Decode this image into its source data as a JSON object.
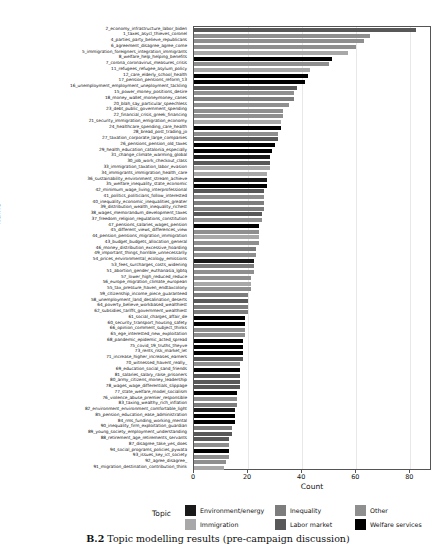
{
  "chart_data": {
    "type": "bar",
    "orientation": "horizontal",
    "title": "",
    "xlabel": "Count",
    "ylabel": "Name",
    "xlim": [
      0,
      88
    ],
    "xticks": [
      0,
      20,
      40,
      60,
      80
    ],
    "grid": true,
    "legend_title": "Topic",
    "legend_position": "bottom",
    "legend": [
      {
        "label": "Environment/energy",
        "color": "#1a1a1a"
      },
      {
        "label": "Inequality",
        "color": "#7d7d7d"
      },
      {
        "label": "Other",
        "color": "#8f8f8f"
      },
      {
        "label": "Immigration",
        "color": "#a8a8a8"
      },
      {
        "label": "Labor market",
        "color": "#585858"
      },
      {
        "label": "Welfare services",
        "color": "#000000"
      }
    ],
    "categories": [
      "2_economy_infrastructure_labor_biden",
      "1_taxes_asycl_thieves_coronel",
      "4_parties_party_believe_republicans",
      "6_agreement_disagree_agree_come",
      "5_immigration_foreigners_integration_immigrants",
      "8_welfare_help_helping_benefits",
      "7_corona_coronavirus_measures_crisis",
      "11_refugees_refugee_asylum_policy",
      "12_care_elderly_school_health",
      "17_pension_pensions_reform_13",
      "16_unemployment_employment_uneployment_tackling",
      "15_power_money_positions_desire",
      "18_money_wallet_moneymoney_canes",
      "20_blah_say_particular_speechless",
      "23_debt_public_government_spending",
      "22_financial_crisis_greek_financing",
      "21_security_immigration_emigration_economy",
      "24_healthcare_spending_care_health",
      "28_bread_post_trading_jo",
      "27_taxation_corporate_large_companies",
      "26_pensions_pension_old_taxes",
      "29_health_education_catalonia_especially",
      "31_change_climate_warming_global",
      "30_job_work_checkout_class",
      "33_immigration_taxation_labor_evasion",
      "34_immigrants_immigration_health_care",
      "36_sustainability_environment_stream_achieve",
      "35_welfare_inequality_state_economic",
      "42_minimum_wage_living_interprofessional",
      "41_politics_politicians_follow_interested",
      "40_inequality_economic_inequalities_greater",
      "39_distribution_wealth_inequality_richest",
      "38_wages_memorandum_development_taxes",
      "37_freedom_religion_regulations_constitution",
      "47_pensions_salaries_wages_pension",
      "45_different_views_differences_view",
      "44_pension_pensions_migration_immigration",
      "43_budget_budgets_allocation_general",
      "46_money_distribution_excessive_hoarding",
      "49_important_things_horrible_unnecessarily",
      "54_prices_environmental_ecology_emissions",
      "53_fees_surcharges_costs_widening",
      "51_abortion_gender_euthanasia_lgbtq",
      "57_lower_high_reduced_reduce",
      "56_europe_migration_climate_european",
      "55_tax_pressure_haven_endtaxcolony",
      "59_citizenship_income_piece_guaranteed",
      "58_unemployment_land_desalination_deserts",
      "64_poverty_believe_workbased_wealthiest",
      "62_subsidies_tariffs_government_wealthiest",
      "61_social_charges_affair_de",
      "60_security_transport_housing_safety",
      "66_opinion_comment_subject_thinks",
      "65_ege_interested_new_exploitation",
      "68_pandemic_epidemic_acted_spread",
      "75_covid_19_truths_theyve",
      "73_rents_risk_market_let",
      "71_increase_higher_increases_earners",
      "70_witnessed_havent_really_",
      "69_education_social_sand_friends",
      "81_salaries_salary_raise_prisoners",
      "80_army_citizens_money_leadership",
      "78_wages_wage_differentials_slippage",
      "77_state_welfare_model_socialism",
      "76_violence_abuse_premier_responsible",
      "83_taxing_wealthy_rich_inflation",
      "82_environment_environment_comfortable_light",
      "85_pension_education_ease_administration",
      "84_rms_funding_working_mental",
      "90_inequality_firm_exploitation_guardian",
      "89_young_society_employment_understanding",
      "88_retirement_age_retirements_servants",
      "87_disagree_take_yes_does",
      "94_social_programs_policies_pywata",
      "93_issues_key_ict_society",
      "92_agree_disagree_",
      "91_migration_destination_contribution_think"
    ],
    "values": [
      82,
      65,
      63,
      60,
      57,
      51,
      50,
      43,
      42,
      41,
      38,
      37,
      37,
      35,
      33,
      33,
      32,
      32,
      31,
      31,
      30,
      29,
      28,
      28,
      28,
      27,
      27,
      27,
      26,
      26,
      26,
      26,
      25,
      25,
      24,
      24,
      24,
      24,
      23,
      23,
      22,
      22,
      22,
      21,
      21,
      21,
      20,
      20,
      20,
      20,
      19,
      19,
      19,
      19,
      18,
      18,
      18,
      18,
      17,
      17,
      17,
      17,
      17,
      16,
      16,
      16,
      15,
      15,
      15,
      14,
      14,
      13,
      13,
      13,
      13,
      12,
      11
    ],
    "bar_colors": [
      "#585858",
      "#8f8f8f",
      "#8f8f8f",
      "#8f8f8f",
      "#a8a8a8",
      "#000000",
      "#8f8f8f",
      "#a8a8a8",
      "#000000",
      "#000000",
      "#585858",
      "#8f8f8f",
      "#7d7d7d",
      "#8f8f8f",
      "#8f8f8f",
      "#8f8f8f",
      "#a8a8a8",
      "#000000",
      "#8f8f8f",
      "#585858",
      "#000000",
      "#000000",
      "#1a1a1a",
      "#585858",
      "#a8a8a8",
      "#a8a8a8",
      "#1a1a1a",
      "#000000",
      "#585858",
      "#8f8f8f",
      "#7d7d7d",
      "#7d7d7d",
      "#585858",
      "#8f8f8f",
      "#000000",
      "#8f8f8f",
      "#a8a8a8",
      "#8f8f8f",
      "#7d7d7d",
      "#8f8f8f",
      "#1a1a1a",
      "#7d7d7d",
      "#8f8f8f",
      "#8f8f8f",
      "#a8a8a8",
      "#8f8f8f",
      "#7d7d7d",
      "#585858",
      "#7d7d7d",
      "#7d7d7d",
      "#000000",
      "#000000",
      "#8f8f8f",
      "#8f8f8f",
      "#000000",
      "#000000",
      "#000000",
      "#585858",
      "#8f8f8f",
      "#000000",
      "#585858",
      "#585858",
      "#585858",
      "#000000",
      "#8f8f8f",
      "#7d7d7d",
      "#1a1a1a",
      "#000000",
      "#000000",
      "#7d7d7d",
      "#585858",
      "#585858",
      "#8f8f8f",
      "#000000",
      "#8f8f8f",
      "#8f8f8f",
      "#a8a8a8"
    ]
  },
  "caption": {
    "prefix": "B.2",
    "text": "Topic modelling results (pre-campaign discussion)"
  }
}
